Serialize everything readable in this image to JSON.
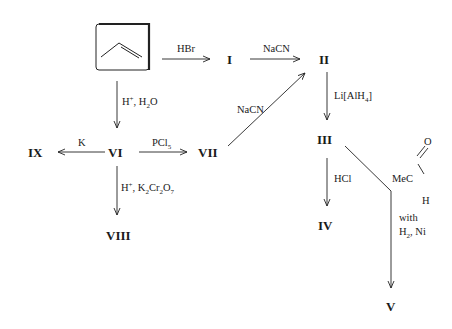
{
  "diagram": {
    "type": "reaction-scheme",
    "start_material": {
      "name": "propene",
      "representation": "skeletal-structure-in-box"
    },
    "compounds": {
      "I": "I",
      "II": "II",
      "III": "III",
      "IV": "IV",
      "V": "V",
      "VI": "VI",
      "VII": "VII",
      "VIII": "VIII",
      "IX": "IX"
    },
    "reagents": {
      "hbr": "HBr",
      "nacn_1": "NaCN",
      "nacn_2": "NaCN",
      "lialh4_pre": "Li[AlH",
      "lialh4_sub": "4",
      "lialh4_post": "]",
      "h_plus": "H",
      "plus_sup": "+",
      "h2o_pre": ", H",
      "h2o_sub": "2",
      "h2o_post": "O",
      "k": "K",
      "pcl5_pre": "PCl",
      "pcl5_sub": "5",
      "dichromate_pre": ", K",
      "dichromate_sub1": "2",
      "dichromate_mid": "Cr",
      "dichromate_sub2": "2",
      "dichromate_mid2": "O",
      "dichromate_sub3": "7",
      "hcl": "HCl",
      "mecho_mec": "MeC",
      "mecho_o": "O",
      "mecho_h": "H",
      "with": "with",
      "h2ni_pre": "H",
      "h2ni_sub": "2",
      "h2ni_post": ", Ni"
    },
    "edges": [
      {
        "from": "propene",
        "to": "I",
        "reagent": "HBr"
      },
      {
        "from": "I",
        "to": "II",
        "reagent": "NaCN"
      },
      {
        "from": "II",
        "to": "III",
        "reagent": "Li[AlH4]"
      },
      {
        "from": "III",
        "to": "IV",
        "reagent": "HCl"
      },
      {
        "from": "III",
        "to": "V",
        "reagent": "MeCHO with H2, Ni"
      },
      {
        "from": "propene",
        "to": "VI",
        "reagent": "H+, H2O"
      },
      {
        "from": "VI",
        "to": "IX",
        "reagent": "K"
      },
      {
        "from": "VI",
        "to": "VII",
        "reagent": "PCl5"
      },
      {
        "from": "VII",
        "to": "II",
        "reagent": "NaCN"
      },
      {
        "from": "VI",
        "to": "VIII",
        "reagent": "H+, K2Cr2O7"
      }
    ]
  }
}
